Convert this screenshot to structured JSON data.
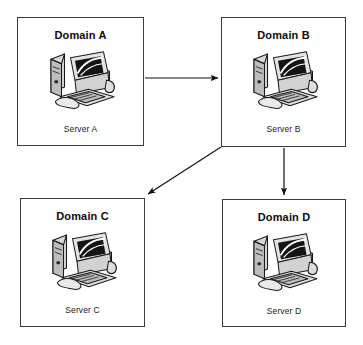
{
  "diagram": {
    "type": "network-topology",
    "canvas": {
      "width": 363,
      "height": 345,
      "background": "#ffffff"
    },
    "stroke_color": "#3b3b3b",
    "arrow_color": "#111111"
  },
  "nodes": [
    {
      "id": "domain-a",
      "title": "Domain A",
      "server_label": "Server A",
      "icon": "desktop-computer-icon",
      "x": 17,
      "y": 17,
      "width": 127,
      "height": 129
    },
    {
      "id": "domain-b",
      "title": "Domain B",
      "server_label": "Server B",
      "icon": "desktop-computer-icon",
      "x": 221,
      "y": 17,
      "width": 125,
      "height": 130
    },
    {
      "id": "domain-c",
      "title": "Domain C",
      "server_label": "Server C",
      "icon": "desktop-computer-icon",
      "x": 20,
      "y": 198,
      "width": 125,
      "height": 129
    },
    {
      "id": "domain-d",
      "title": "Domain D",
      "server_label": "Server D",
      "icon": "desktop-computer-icon",
      "x": 222,
      "y": 199,
      "width": 124,
      "height": 128
    }
  ],
  "connections": [
    {
      "id": "a-to-b",
      "from": "domain-a",
      "to": "domain-b",
      "style": "straight-horizontal",
      "direction": "right"
    },
    {
      "id": "b-to-c",
      "from": "domain-b",
      "to": "domain-c",
      "style": "diagonal",
      "direction": "down-left"
    },
    {
      "id": "b-to-d",
      "from": "domain-b",
      "to": "domain-d",
      "style": "straight-vertical",
      "direction": "down"
    }
  ]
}
